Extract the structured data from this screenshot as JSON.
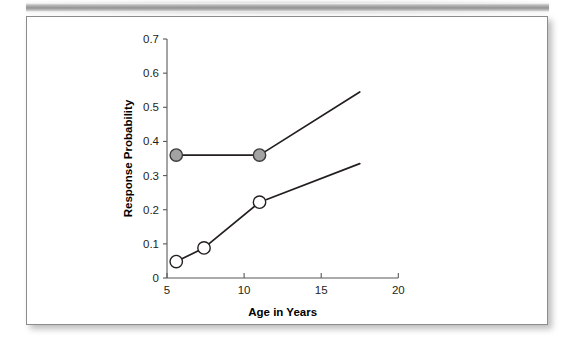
{
  "figure": {
    "background_color": "#ffffff",
    "border_color": "#8c8c8c",
    "top_band_color": "#8e8e8e"
  },
  "chart_data": {
    "type": "line",
    "title": "",
    "xlabel": "Age in Years",
    "ylabel": "Response Probability",
    "xlim": [
      5,
      20
    ],
    "ylim": [
      0,
      0.7
    ],
    "xticks": [
      "5",
      "10",
      "15",
      "20"
    ],
    "xtick_values": [
      5,
      10,
      15,
      20
    ],
    "yticks": [
      "0",
      "0.1",
      "0.2",
      "0.3",
      "0.4",
      "0.5",
      "0.6",
      "0.7"
    ],
    "ytick_values": [
      0,
      0.1,
      0.2,
      0.3,
      0.4,
      0.5,
      0.6,
      0.7
    ],
    "grid": false,
    "legend": false,
    "legend_position": "none",
    "series": [
      {
        "name": "Filled-marker series",
        "marker": "filled-circle",
        "marker_fill_color": "#a3a3a3",
        "marker_edge_color": "#3b3b3b",
        "line_color": "#231f20",
        "x": [
          5.6,
          11.0,
          17.5
        ],
        "y": [
          0.36,
          0.36,
          0.545
        ],
        "marker_x": [
          5.6,
          11.0
        ],
        "marker_y": [
          0.36,
          0.36
        ]
      },
      {
        "name": "Open-marker series",
        "marker": "open-circle",
        "marker_fill_color": "#ffffff",
        "marker_edge_color": "#231f20",
        "line_color": "#231f20",
        "x": [
          5.6,
          7.4,
          11.0,
          17.5
        ],
        "y": [
          0.048,
          0.088,
          0.222,
          0.335
        ],
        "marker_x": [
          5.6,
          7.4,
          11.0
        ],
        "marker_y": [
          0.048,
          0.088,
          0.222
        ]
      }
    ]
  }
}
